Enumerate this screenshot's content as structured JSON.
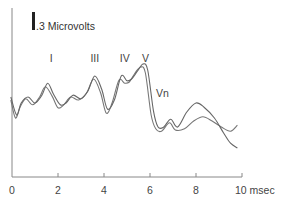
{
  "chart_data": {
    "type": "line",
    "title": "",
    "xlabel": "msec",
    "ylabel": "",
    "xlim": [
      0,
      10
    ],
    "x_ticks": [
      0,
      2,
      4,
      6,
      8,
      10
    ],
    "x_tick_labels": [
      "0",
      "2",
      "4",
      "6",
      "8",
      "10 msec"
    ],
    "grid": false,
    "scale_bar": {
      "value": 0.3,
      "unit": "Microvolts",
      "label": ".3 Microvolts"
    },
    "peak_labels": [
      {
        "label": "I",
        "x": 1.7
      },
      {
        "label": "III",
        "x": 3.6
      },
      {
        "label": "IV",
        "x": 4.9
      },
      {
        "label": "V",
        "x": 5.8
      },
      {
        "label": "Vn",
        "x": 6.5
      }
    ],
    "series": [
      {
        "name": "trace-1",
        "x": [
          -0.05,
          0.15,
          0.35,
          0.6,
          0.9,
          1.2,
          1.45,
          1.75,
          2.0,
          2.25,
          2.55,
          2.9,
          3.25,
          3.55,
          3.85,
          4.1,
          4.35,
          4.65,
          4.9,
          5.1,
          5.35,
          5.6,
          5.8,
          6.05,
          6.25,
          6.5,
          6.85,
          7.1,
          7.5,
          7.9,
          8.3,
          8.7,
          9.1,
          9.5,
          9.8
        ],
        "values": [
          0.0,
          -0.3,
          -0.12,
          0.02,
          -0.08,
          0.05,
          0.22,
          0.06,
          -0.13,
          -0.08,
          0.05,
          0.0,
          0.12,
          0.35,
          0.12,
          -0.22,
          -0.05,
          0.33,
          0.28,
          0.3,
          0.45,
          0.55,
          0.45,
          -0.25,
          -0.48,
          -0.52,
          -0.38,
          -0.5,
          -0.48,
          -0.35,
          -0.28,
          -0.35,
          -0.45,
          -0.52,
          -0.42
        ]
      },
      {
        "name": "trace-2",
        "x": [
          -0.05,
          0.2,
          0.4,
          0.7,
          1.0,
          1.3,
          1.55,
          1.8,
          2.1,
          2.35,
          2.65,
          3.0,
          3.3,
          3.6,
          3.9,
          4.15,
          4.45,
          4.75,
          5.0,
          5.2,
          5.45,
          5.7,
          5.9,
          6.15,
          6.35,
          6.6,
          6.9,
          7.2,
          7.6,
          8.0,
          8.35,
          8.8,
          9.2,
          9.5,
          9.8
        ],
        "values": [
          0.05,
          -0.25,
          -0.05,
          0.05,
          -0.05,
          0.08,
          0.28,
          0.1,
          -0.08,
          -0.05,
          0.08,
          0.02,
          0.15,
          0.4,
          0.18,
          -0.15,
          0.0,
          0.4,
          0.32,
          0.35,
          0.48,
          0.6,
          0.5,
          -0.18,
          -0.45,
          -0.45,
          -0.32,
          -0.45,
          -0.2,
          -0.05,
          -0.12,
          -0.3,
          -0.55,
          -0.72,
          -0.8
        ]
      }
    ]
  }
}
